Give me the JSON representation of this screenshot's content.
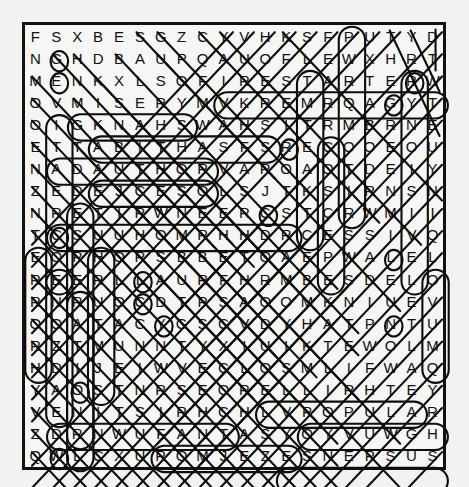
{
  "puzzle": {
    "type": "word-search",
    "rows": 21,
    "cols": 21,
    "background_color": "#f2f2f0",
    "grid_background_color": "#f6f6f4",
    "border_color": "#111111",
    "letter_color": "#111111",
    "mark_color": "#0d0d0d",
    "grid": [
      "FSXBESGZCYVHKSFPUTYD",
      "NGHDBAUPQAUOFLEWXHRT",
      "MENKXLSOFIRESTARTERW",
      "OVMISERYMVKREMRQAGYT",
      "OIGKNAHSWAHSITRMBRNE",
      "ETTABITHASFSRECOOEOU",
      "NADAUTHORVAROAOTDEIY",
      "ZEDEJCESOLSJTKSIRNSN",
      "NRETIRWNEERCSTCRWMII",
      "TCSUUHOMRHHDRCESSIVQ",
      "EOPHORSBBETOAEPWALEL",
      "REERLLAURFHRMBESDELO",
      "RNRUOCDTPSAOOMKNIUEV",
      "OOATACYGSCVDYHATPNTU",
      "RZTMUNNTYXIUIKTEWOLMT",
      "HDIJEIWVECLOSMLIFWAQ",
      "YAOSTNRSEORELLIRHTEY",
      "VENITSIRHCHLVPOPULAR",
      "ZDRNWUFANTASYOYVUWGH",
      "QWLCXUROMJEZESNEPSUS"
    ],
    "grid_rows": [
      [
        "F",
        "S",
        "X",
        "B",
        "E",
        "S",
        "G",
        "Z",
        "C",
        "Y",
        "V",
        "H",
        "K",
        "S",
        "F",
        "P",
        "U",
        "T",
        "Y",
        "D"
      ],
      [
        "N",
        "G",
        "H",
        "D",
        "B",
        "A",
        "U",
        "P",
        "Q",
        "A",
        "U",
        "O",
        "F",
        "L",
        "E",
        "W",
        "X",
        "H",
        "R",
        "T"
      ],
      [
        "M",
        "E",
        "N",
        "K",
        "X",
        "L",
        "S",
        "O",
        "F",
        "I",
        "R",
        "E",
        "S",
        "T",
        "A",
        "R",
        "T",
        "E",
        "R",
        "W"
      ],
      [
        "O",
        "V",
        "M",
        "I",
        "S",
        "E",
        "R",
        "Y",
        "M",
        "V",
        "K",
        "R",
        "E",
        "M",
        "R",
        "Q",
        "A",
        "G",
        "Y",
        "T"
      ],
      [
        "O",
        "I",
        "G",
        "K",
        "N",
        "A",
        "H",
        "S",
        "W",
        "A",
        "H",
        "S",
        "I",
        "T",
        "R",
        "M",
        "B",
        "R",
        "N",
        "E"
      ],
      [
        "E",
        "T",
        "T",
        "A",
        "B",
        "I",
        "T",
        "H",
        "A",
        "S",
        "F",
        "S",
        "R",
        "E",
        "C",
        "O",
        "O",
        "E",
        "O",
        "U"
      ],
      [
        "N",
        "A",
        "D",
        "A",
        "U",
        "T",
        "H",
        "O",
        "R",
        "V",
        "A",
        "R",
        "O",
        "A",
        "O",
        "T",
        "D",
        "E",
        "I",
        "Y"
      ],
      [
        "Z",
        "E",
        "D",
        "E",
        "J",
        "C",
        "E",
        "S",
        "O",
        "L",
        "S",
        "J",
        "T",
        "K",
        "S",
        "I",
        "R",
        "N",
        "S",
        "N"
      ],
      [
        "N",
        "R",
        "E",
        "T",
        "I",
        "R",
        "W",
        "N",
        "E",
        "E",
        "R",
        "C",
        "S",
        "T",
        "C",
        "R",
        "W",
        "M",
        "I",
        "I"
      ],
      [
        "T",
        "C",
        "S",
        "U",
        "U",
        "H",
        "O",
        "M",
        "R",
        "H",
        "H",
        "D",
        "R",
        "C",
        "E",
        "S",
        "S",
        "I",
        "V",
        "Q"
      ],
      [
        "E",
        "O",
        "P",
        "H",
        "O",
        "R",
        "S",
        "B",
        "B",
        "E",
        "T",
        "O",
        "A",
        "E",
        "P",
        "W",
        "A",
        "L",
        "E",
        "L"
      ],
      [
        "R",
        "E",
        "E",
        "R",
        "L",
        "L",
        "A",
        "U",
        "R",
        "F",
        "H",
        "R",
        "M",
        "B",
        "E",
        "S",
        "D",
        "E",
        "L",
        "O"
      ],
      [
        "R",
        "N",
        "R",
        "U",
        "O",
        "C",
        "D",
        "T",
        "P",
        "S",
        "A",
        "O",
        "O",
        "M",
        "K",
        "N",
        "I",
        "U",
        "E",
        "V"
      ],
      [
        "O",
        "O",
        "A",
        "T",
        "A",
        "C",
        "Y",
        "G",
        "S",
        "C",
        "V",
        "D",
        "Y",
        "H",
        "A",
        "T",
        "P",
        "N",
        "T",
        "U"
      ],
      [
        "R",
        "Z",
        "T",
        "M",
        "U",
        "N",
        "N",
        "T",
        "Y",
        "X",
        "I",
        "U",
        "I",
        "K",
        "T",
        "E",
        "W",
        "O",
        "L",
        "M"
      ],
      [
        "H",
        "D",
        "I",
        "J",
        "E",
        "I",
        "W",
        "V",
        "E",
        "C",
        "L",
        "O",
        "S",
        "M",
        "L",
        "I",
        "F",
        "W",
        "A",
        "Q"
      ],
      [
        "Y",
        "A",
        "O",
        "S",
        "T",
        "N",
        "R",
        "S",
        "E",
        "O",
        "R",
        "E",
        "L",
        "L",
        "I",
        "R",
        "H",
        "T",
        "E",
        "Y"
      ],
      [
        "V",
        "E",
        "N",
        "I",
        "T",
        "S",
        "I",
        "R",
        "H",
        "C",
        "H",
        "L",
        "V",
        "P",
        "O",
        "P",
        "U",
        "L",
        "A",
        "R"
      ],
      [
        "Z",
        "D",
        "R",
        "N",
        "W",
        "U",
        "F",
        "A",
        "N",
        "T",
        "A",
        "S",
        "Y",
        "O",
        "Y",
        "V",
        "U",
        "W",
        "G",
        "H"
      ],
      [
        "Q",
        "W",
        "L",
        "C",
        "X",
        "U",
        "R",
        "O",
        "M",
        "J",
        "E",
        "Z",
        "E",
        "S",
        "N",
        "E",
        "P",
        "S",
        "U",
        "S"
      ]
    ],
    "found_words": [
      {
        "word": "FIRESTARTER",
        "row": 3,
        "start_col": 9,
        "end_col": 19,
        "direction": "horizontal"
      },
      {
        "word": "MISERY",
        "row": 4,
        "start_col": 2,
        "end_col": 7,
        "direction": "horizontal"
      },
      {
        "word": "SHAWSHANK",
        "row": 5,
        "start_col": 3,
        "end_col": 11,
        "direction": "horizontal-reversed"
      },
      {
        "word": "TABITHA",
        "row": 6,
        "start_col": 1,
        "end_col": 8,
        "direction": "horizontal"
      },
      {
        "word": "AUTHOR",
        "row": 7,
        "start_col": 3,
        "end_col": 8,
        "direction": "horizontal"
      },
      {
        "word": "SCREENWRITER",
        "row": 9,
        "start_col": 1,
        "end_col": 12,
        "direction": "horizontal-reversed"
      },
      {
        "word": "CHRISTINE",
        "row": 18,
        "start_col": 1,
        "end_col": 9,
        "direction": "horizontal-reversed"
      },
      {
        "word": "POPULAR",
        "row": 18,
        "start_col": 13,
        "end_col": 19,
        "direction": "horizontal"
      },
      {
        "word": "FANTASY",
        "row": 19,
        "start_col": 6,
        "end_col": 12,
        "direction": "horizontal"
      },
      {
        "word": "SUSPENSE",
        "row": 20,
        "start_col": 12,
        "end_col": 19,
        "direction": "horizontal-reversed"
      },
      {
        "word": "THRILLER",
        "row": 17,
        "start_col": 11,
        "end_col": 18,
        "direction": "horizontal-reversed"
      },
      {
        "word": "CREATIVE",
        "col": 1,
        "start_row": 11,
        "end_row": 4,
        "direction": "vertical-reversed"
      },
      {
        "word": "DESPERATION",
        "col": 2,
        "start_row": 8,
        "end_row": 18,
        "direction": "vertical"
      },
      {
        "word": "TERROR",
        "col": 0,
        "start_row": 10,
        "end_row": 15,
        "direction": "vertical"
      },
      {
        "word": "NOVEL",
        "col": 19,
        "start_row": 11,
        "end_row": 15,
        "direction": "vertical-reversed"
      }
    ],
    "caption": ""
  }
}
